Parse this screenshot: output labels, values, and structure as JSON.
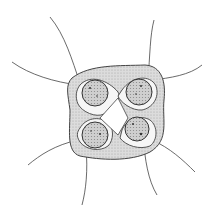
{
  "illustration": {
    "subject": "four-celled colonial alga with flagella",
    "cell_count": 4,
    "flagella_count": 8,
    "colors": {
      "background": "#ffffff",
      "ink": "#333333",
      "matrix_fill": "#d4d4d4",
      "cell_fill": "#c8c8c8"
    }
  }
}
